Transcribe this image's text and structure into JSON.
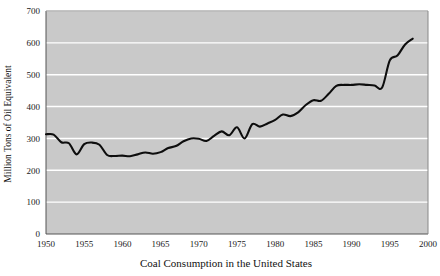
{
  "chart_data": {
    "type": "line",
    "title": "",
    "xlabel": "Coal Consumption in the United States",
    "ylabel": "Million Tons of Oil Equivalent",
    "xlim": [
      1950,
      2000
    ],
    "ylim": [
      0,
      700
    ],
    "xticks": [
      1950,
      1955,
      1960,
      1965,
      1970,
      1975,
      1980,
      1985,
      1990,
      1995,
      2000
    ],
    "yticks": [
      0,
      100,
      200,
      300,
      400,
      500,
      600,
      700
    ],
    "grid": "horizontal",
    "legend": "none",
    "plot_background": "#c9c9c9",
    "gridline_color": "#ffffff",
    "line_color": "#000000",
    "series": [
      {
        "name": "Coal Consumption",
        "x": [
          1950,
          1951,
          1952,
          1953,
          1954,
          1955,
          1956,
          1957,
          1958,
          1959,
          1960,
          1961,
          1962,
          1963,
          1964,
          1965,
          1966,
          1967,
          1968,
          1969,
          1970,
          1971,
          1972,
          1973,
          1974,
          1975,
          1976,
          1977,
          1978,
          1979,
          1980,
          1981,
          1982,
          1983,
          1984,
          1985,
          1986,
          1987,
          1988,
          1989,
          1990,
          1991,
          1992,
          1993,
          1994,
          1995,
          1996,
          1997,
          1998
        ],
        "values": [
          313,
          312,
          288,
          285,
          250,
          282,
          287,
          280,
          248,
          245,
          246,
          244,
          250,
          256,
          252,
          257,
          270,
          276,
          291,
          300,
          299,
          292,
          308,
          322,
          310,
          335,
          300,
          345,
          337,
          347,
          358,
          375,
          370,
          382,
          405,
          420,
          418,
          440,
          465,
          468,
          468,
          470,
          468,
          466,
          460,
          545,
          560,
          595,
          613
        ]
      }
    ]
  },
  "axis_labels": {
    "y_title": "Million Tons of Oil Equivalent",
    "x_title": "Coal Consumption in the United States"
  }
}
